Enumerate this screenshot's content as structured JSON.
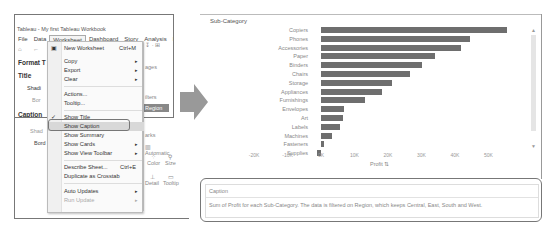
{
  "left_window": {
    "title": "Tableau - My first Tableau Workbook",
    "menubar": [
      "File",
      "Data",
      "Worksheet",
      "Dashboard",
      "Story",
      "Analysis",
      "Map"
    ],
    "active_menu": "Worksheet",
    "format_pane": {
      "header": "Format T",
      "title_section": "Title",
      "title_shading": "Shadi",
      "title_border": "Bor",
      "caption_section": "Caption",
      "caption_shading": "Shad",
      "caption_border": "Bord"
    },
    "worksheet_menu": {
      "items": [
        {
          "label": "New Worksheet",
          "shortcut": "Ctrl+M",
          "icon": "new-sheet-icon"
        },
        {
          "label": "Copy",
          "submenu": true
        },
        {
          "label": "Export",
          "submenu": true
        },
        {
          "label": "Clear",
          "submenu": true
        },
        {
          "label": "Actions..."
        },
        {
          "label": "Tooltip..."
        },
        {
          "label": "Show Title",
          "checked": true
        },
        {
          "label": "Show Caption",
          "highlighted": true
        },
        {
          "label": "Show Summary"
        },
        {
          "label": "Show Cards",
          "submenu": true
        },
        {
          "label": "Show View Toolbar",
          "submenu": true
        },
        {
          "label": "Describe Sheet...",
          "shortcut": "Ctrl+E"
        },
        {
          "label": "Duplicate as Crosstab"
        },
        {
          "label": "Auto Updates",
          "submenu": true
        },
        {
          "label": "Run Update",
          "submenu": true,
          "disabled": true
        }
      ],
      "arrow_glyph": "▸",
      "check_glyph": "✓"
    },
    "side_panel": {
      "pages_label": "ages",
      "filters_label": "ilters",
      "filter_pill": "Region",
      "marks_label": "arks",
      "mark_type": "Automatic",
      "color_label": "Color",
      "size_label": "Size",
      "detail_label": "Detail",
      "tooltip_label": "Tooltip"
    }
  },
  "chart_panel": {
    "header": "Sub-Category",
    "axis_title": "Profit",
    "caption_title": "Caption",
    "caption_text": "Sum of Profit for each Sub-Category. The data is filtered on Region, which keeps Central, East, South and West."
  },
  "chart_data": {
    "type": "bar",
    "orientation": "horizontal",
    "title": "",
    "ylabel": "Sub-Category",
    "xlabel": "Profit",
    "categories": [
      "Copiers",
      "Phones",
      "Accessories",
      "Paper",
      "Binders",
      "Chairs",
      "Storage",
      "Appliances",
      "Furnishings",
      "Envelopes",
      "Art",
      "Labels",
      "Machines",
      "Fasteners",
      "Supplies"
    ],
    "values": [
      55618,
      44516,
      41937,
      34054,
      30222,
      26590,
      21279,
      18138,
      13059,
      6964,
      6528,
      5546,
      3385,
      950,
      -1189
    ],
    "xticks": [
      "-20K",
      "-10K",
      "0K",
      "10K",
      "20K",
      "30K",
      "40K",
      "50K"
    ],
    "xlim": [
      -25000,
      60000
    ],
    "grid": false,
    "bar_color": "#6e6e6e"
  }
}
